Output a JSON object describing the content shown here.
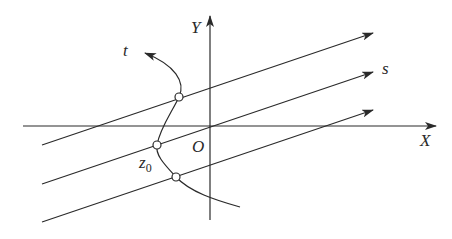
{
  "diagram": {
    "type": "coordinate-diagram",
    "labels": {
      "x_axis": "X",
      "y_axis": "Y",
      "origin": "O",
      "curve": "t",
      "lines": "s",
      "point": "z",
      "point_subscript": "0"
    },
    "colors": {
      "stroke": "#2a2a2a",
      "background": "#ffffff"
    },
    "parallel_lines_count": 3,
    "intersection_points_count": 3
  }
}
